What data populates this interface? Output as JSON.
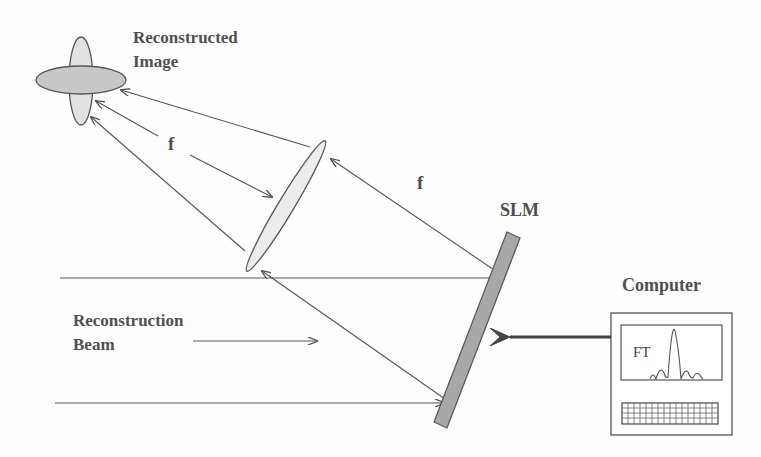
{
  "diagram": {
    "type": "optical-setup",
    "labels": {
      "reconstructed_image_line1": "Reconstructed",
      "reconstructed_image_line2": "Image",
      "focal_length_left": "f",
      "focal_length_right": "f",
      "slm": "SLM",
      "computer": "Computer",
      "reconstruction_beam_line1": "Reconstruction",
      "reconstruction_beam_line2": "Beam",
      "fourier_transform": "FT"
    },
    "components": [
      {
        "id": "reconstructed-image",
        "shape": "crossed-ellipses"
      },
      {
        "id": "lens",
        "shape": "thin-ellipse"
      },
      {
        "id": "slm",
        "shape": "tilted-bar"
      },
      {
        "id": "computer",
        "shape": "monitor-with-keyboard"
      }
    ],
    "colors": {
      "line": "#555555",
      "slm_fill": "#a8a8a8",
      "image_fill_h": "#c8c8c8",
      "image_fill_v": "#e2e2e2",
      "lens_fill": "#ececec",
      "text": "#505050"
    }
  }
}
